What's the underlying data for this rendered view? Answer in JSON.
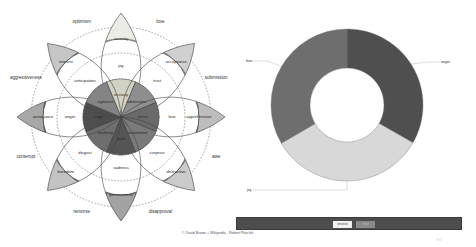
{
  "wheel": {
    "title": "Plutchik wheel of emotions",
    "center": [
      121,
      117
    ],
    "petal_length": 104,
    "petals": [
      {
        "angle": 0,
        "inner": "ecstasy",
        "middle": "joy",
        "outer": "serenity",
        "colors": [
          "#d2d2c4",
          "#e0e0d6",
          "#ececE6"
        ]
      },
      {
        "angle": 45,
        "inner": "admiration",
        "middle": "trust",
        "outer": "acceptance",
        "colors": [
          "#8e8e8e",
          "#b4b4b4",
          "#d0d0d0"
        ]
      },
      {
        "angle": 90,
        "inner": "terror",
        "middle": "fear",
        "outer": "apprehension",
        "colors": [
          "#6a6a6a",
          "#8e8e8e",
          "#bdbdbd"
        ]
      },
      {
        "angle": 135,
        "inner": "amazement",
        "middle": "surprise",
        "outer": "distraction",
        "colors": [
          "#7a7a7a",
          "#a6a6a6",
          "#cbcbcb"
        ]
      },
      {
        "angle": 180,
        "inner": "grief",
        "middle": "sadness",
        "outer": "pensiveness",
        "colors": [
          "#555555",
          "#7c7c7c",
          "#a3a3a3"
        ]
      },
      {
        "angle": 225,
        "inner": "loathing",
        "middle": "disgust",
        "outer": "boredom",
        "colors": [
          "#6e6e6e",
          "#959595",
          "#c3c3c3"
        ]
      },
      {
        "angle": 270,
        "inner": "rage",
        "middle": "anger",
        "outer": "annoyance",
        "colors": [
          "#4e4e4e",
          "#6d6d6d",
          "#a8a8a8"
        ]
      },
      {
        "angle": 315,
        "inner": "vigilance",
        "middle": "anticipation",
        "outer": "interest",
        "colors": [
          "#848484",
          "#a2a2a2",
          "#c6c6c6"
        ]
      }
    ],
    "dyads": [
      {
        "angle": 337.5,
        "label": "optimism"
      },
      {
        "angle": 22.5,
        "label": "love"
      },
      {
        "angle": 67.5,
        "label": "submission"
      },
      {
        "angle": 112.5,
        "label": "awe"
      },
      {
        "angle": 157.5,
        "label": "disapproval"
      },
      {
        "angle": 202.5,
        "label": "remorse"
      },
      {
        "angle": 247.5,
        "label": "contempt"
      },
      {
        "angle": 292.5,
        "label": "aggressiveness"
      }
    ]
  },
  "chart_data": {
    "type": "pie",
    "subtype": "donut",
    "title": "",
    "categories": [
      "anger",
      "joy",
      "fear"
    ],
    "values": [
      33.3,
      33.3,
      33.4
    ],
    "colors": [
      "#4f4f4f",
      "#d8d8d8",
      "#6e6e6e"
    ],
    "legend": "leader-line labels",
    "center": [
      347,
      105
    ],
    "outer_radius": 76,
    "inner_radius": 37
  },
  "toolbar": {
    "button_primary": "emotion",
    "button_secondary": "reset"
  },
  "footer": {
    "credit": "© David Brown + Wikipedia - Robert Plutchik"
  }
}
